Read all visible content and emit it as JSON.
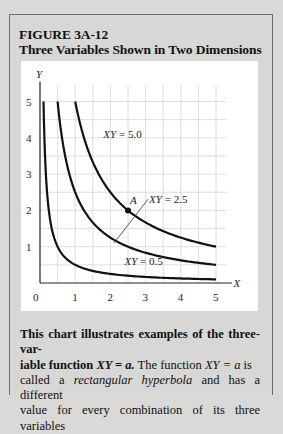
{
  "figure": {
    "label": "FIGURE 3A-12",
    "title": "Three Variables Shown in Two Dimensions"
  },
  "caption": {
    "bold_part": "This chart illustrates examples of the three-variable function XY = a.",
    "line1_bold": "This chart illustrates examples of the three-var-",
    "line2_bold": "iable function ",
    "line2_bold_eq": "XY = a.",
    "line2_rest_a": " The function ",
    "line2_eq": "XY = a",
    "line2_rest_b": " is",
    "line3_a": "called a ",
    "line3_em": "rectangular hyperbola",
    "line3_b": " and has a different",
    "line4": "value for every combination of its three variables"
  },
  "chart_data": {
    "type": "line",
    "title": "Three Variables Shown in Two Dimensions",
    "xlabel": "X",
    "ylabel": "Y",
    "xlim": [
      0,
      5
    ],
    "ylim": [
      0,
      5
    ],
    "xticks": [
      0,
      1,
      2,
      3,
      4,
      5
    ],
    "yticks": [
      1,
      2,
      3,
      4,
      5
    ],
    "grid": true,
    "grid_step": 0.5,
    "series": [
      {
        "name": "XY = 0.5",
        "a": 0.5,
        "x_range": [
          0.1,
          5
        ]
      },
      {
        "name": "XY = 2.5",
        "a": 2.5,
        "x_range": [
          0.5,
          5
        ]
      },
      {
        "name": "XY = 5.0",
        "a": 5.0,
        "x_range": [
          1.0,
          5
        ]
      }
    ],
    "annotations": [
      {
        "text": "XY = 5.0",
        "x": 1.8,
        "y": 4.0
      },
      {
        "text": "XY = 2.5",
        "x": 3.1,
        "y": 2.2,
        "leader_to": [
          2.1,
          1.1
        ]
      },
      {
        "text": "XY = 0.5",
        "x": 2.4,
        "y": 0.5
      },
      {
        "text": "A",
        "x": 2.5,
        "y": 2.0,
        "marker": "point"
      }
    ]
  }
}
